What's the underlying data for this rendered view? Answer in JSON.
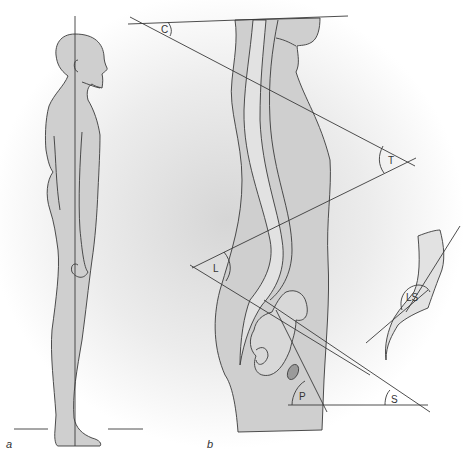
{
  "figure": {
    "panels": [
      {
        "id": "a",
        "label": "a",
        "description": "Standing human figure, side view, with vertical plumb line and ground line"
      },
      {
        "id": "b",
        "label": "b",
        "description": "Sagittal spine silhouette with curvature angles"
      }
    ],
    "angles": [
      {
        "id": "C",
        "label": "C",
        "name": "cervical lordosis angle"
      },
      {
        "id": "T",
        "label": "T",
        "name": "thoracic kyphosis angle"
      },
      {
        "id": "L",
        "label": "L",
        "name": "lumbar lordosis angle"
      },
      {
        "id": "P",
        "label": "P",
        "name": "pelvic angle"
      },
      {
        "id": "S",
        "label": "S",
        "name": "sacral angle"
      },
      {
        "id": "LS",
        "label": "LS",
        "name": "lumbosacral angle (inset)"
      }
    ],
    "colors": {
      "body_fill": "#cfcfcf",
      "canal_fill": "#e2e2e2",
      "line": "#3a3a3a",
      "background_shade": "#dcdcdc"
    }
  }
}
